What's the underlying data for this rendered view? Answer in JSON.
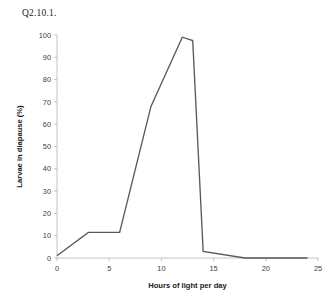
{
  "page": {
    "title": "Q2.10.1."
  },
  "chart_data": {
    "type": "line",
    "title": "",
    "xlabel": "Hours of light per day",
    "ylabel": "Larvae in diapause (%)",
    "xlim": [
      0,
      25
    ],
    "ylim": [
      0,
      100
    ],
    "xticks": [
      0,
      5,
      10,
      15,
      20,
      25
    ],
    "yticks": [
      0,
      10,
      20,
      30,
      40,
      50,
      60,
      70,
      80,
      90,
      100
    ],
    "xtick_labels": [
      "0",
      "5",
      "10",
      "15",
      "20",
      "25"
    ],
    "ytick_labels": [
      "0",
      "10",
      "20",
      "30",
      "40",
      "50",
      "60",
      "70",
      "80",
      "90",
      "100"
    ],
    "grid": false,
    "legend": false,
    "line_color": "#595959",
    "series": [
      {
        "name": "Larvae in diapause",
        "x": [
          0,
          3,
          6,
          9,
          12,
          13,
          14,
          18,
          24
        ],
        "values": [
          1,
          11.5,
          11.5,
          68,
          99,
          97.5,
          3,
          0,
          0
        ]
      }
    ]
  }
}
